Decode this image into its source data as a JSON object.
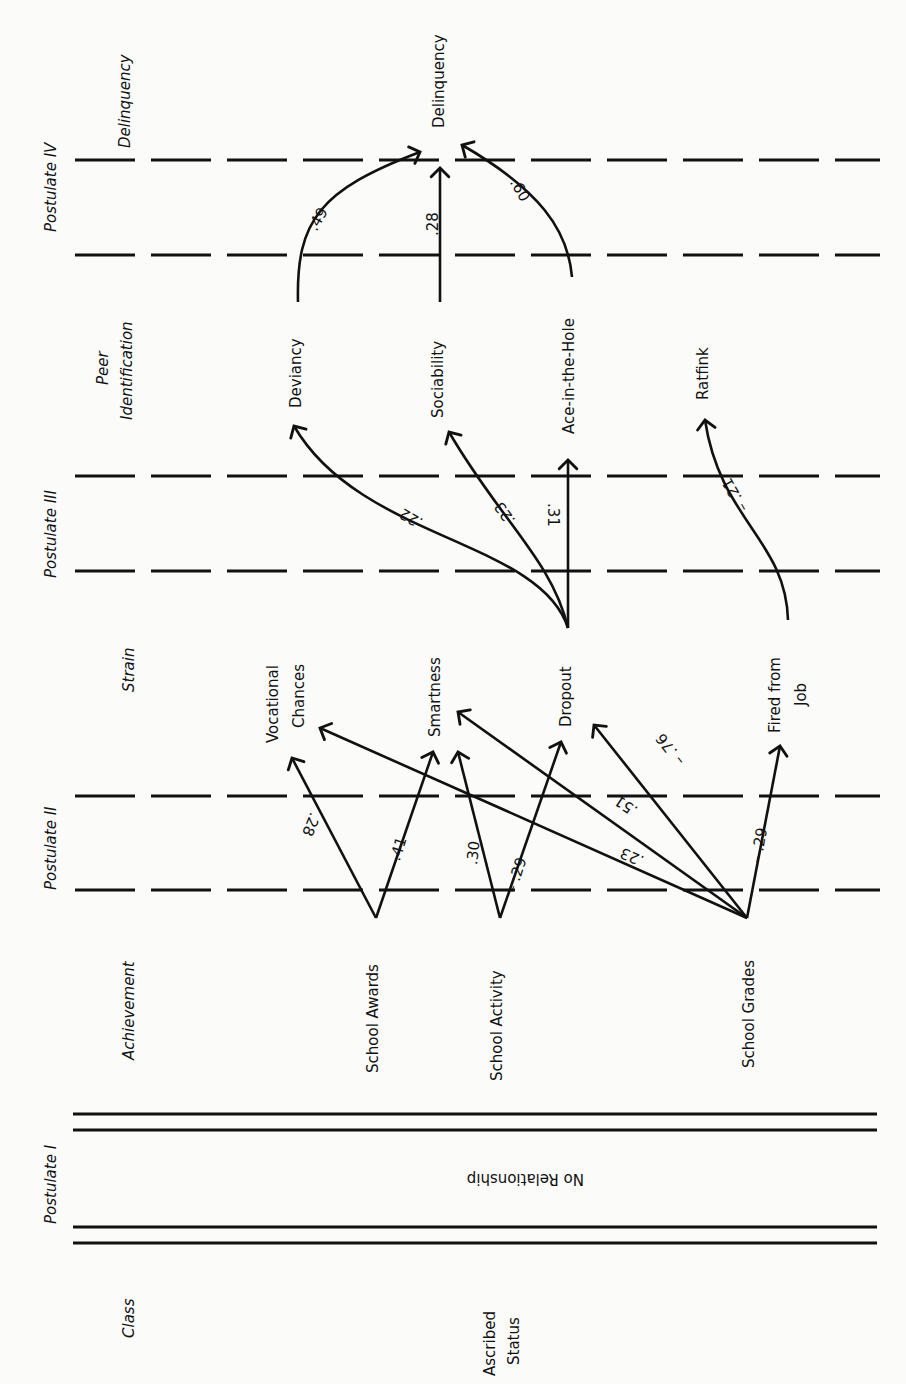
{
  "postulates": [
    {
      "label": "Postulate IV",
      "line_style": "dashed",
      "lines_y": [
        160,
        255
      ]
    },
    {
      "label": "Postulate III",
      "line_style": "dashed",
      "lines_y": [
        476,
        571
      ]
    },
    {
      "label": "Postulate II",
      "line_style": "dashed",
      "lines_y": [
        796,
        890
      ]
    },
    {
      "label": "Postulate I",
      "line_style": "double-solid",
      "lines_y": [
        1114,
        1130,
        1227,
        1243
      ]
    }
  ],
  "stages": {
    "delinquency": "Delinquency",
    "peer_identification_1": "Peer",
    "peer_identification_2": "Identification",
    "strain": "Strain",
    "achievement": "Achievement",
    "class": "Class"
  },
  "nodes": {
    "delinquency": "Delinquency",
    "deviancy": "Deviancy",
    "sociability": "Sociability",
    "ace_in_the_hole": "Ace-in-the-Hole",
    "ratfink": "Ratfink",
    "vocational_chances_1": "Vocational",
    "vocational_chances_2": "Chances",
    "smartness": "Smartness",
    "dropout": "Dropout",
    "fired_from_job_1": "Fired from",
    "fired_from_job_2": "Job",
    "school_awards": "School Awards",
    "school_activity": "School Activity",
    "school_grades": "School Grades",
    "ascribed_status_1": "Ascribed",
    "ascribed_status_2": "Status"
  },
  "no_relationship": "No Relationship",
  "paths": [
    {
      "from": "Deviancy",
      "to": "Delinquency",
      "coef": ".49"
    },
    {
      "from": "Sociability",
      "to": "Delinquency",
      "coef": ".28"
    },
    {
      "from": "Ace-in-the-Hole",
      "to": "Delinquency",
      "coef": ".60"
    },
    {
      "from": "Dropout",
      "to": "Deviancy",
      "coef": ".22"
    },
    {
      "from": "Dropout",
      "to": "Sociability",
      "coef": ".23"
    },
    {
      "from": "Dropout",
      "to": "Ace-in-the-Hole",
      "coef": ".31"
    },
    {
      "from": "Fired from Job",
      "to": "Ratfink",
      "coef": "– .21"
    },
    {
      "from": "School Awards",
      "to": "Vocational Chances",
      "coef": ".28"
    },
    {
      "from": "School Awards",
      "to": "Smartness",
      "coef": ".41"
    },
    {
      "from": "School Activity",
      "to": "Smartness",
      "coef": ".30"
    },
    {
      "from": "School Activity",
      "to": "Dropout",
      "coef": "– .29"
    },
    {
      "from": "School Grades",
      "to": "Vocational Chances",
      "coef": ".23"
    },
    {
      "from": "School Grades",
      "to": "Smartness",
      "coef": ".51"
    },
    {
      "from": "School Grades",
      "to": "Dropout",
      "coef": "– .76"
    },
    {
      "from": "School Grades",
      "to": "Fired from Job",
      "coef": "– .29"
    }
  ],
  "colors": {
    "ink": "#111111",
    "paper": "#fbfbfa"
  }
}
